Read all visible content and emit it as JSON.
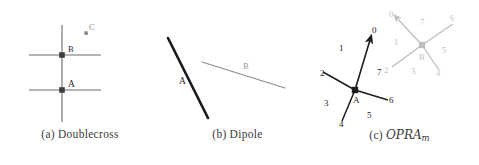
{
  "figure": {
    "panels": [
      {
        "id": "doublecross",
        "caption_label": "(a)",
        "caption_text": "Doublecross",
        "type": "doublecross-diagram",
        "colors": {
          "line": "#6b6b6b",
          "node": "#3d3d3d",
          "label": "#2b2b2b",
          "point": "#8a8a8a"
        },
        "nodes": [
          {
            "name": "A",
            "label": "A",
            "x": 62,
            "y": 90
          },
          {
            "name": "B",
            "label": "B",
            "x": 62,
            "y": 55
          },
          {
            "name": "C",
            "label": "C",
            "x": 86,
            "y": 33
          }
        ],
        "lines": [
          {
            "name": "vertical-axis",
            "x1": 62,
            "y1": 25,
            "x2": 62,
            "y2": 122
          },
          {
            "name": "horizontal-axis-b",
            "x1": 29,
            "y1": 55,
            "x2": 101,
            "y2": 55
          },
          {
            "name": "horizontal-axis-a",
            "x1": 29,
            "y1": 90,
            "x2": 101,
            "y2": 90
          }
        ]
      },
      {
        "id": "dipole",
        "caption_label": "(b)",
        "caption_text": "Dipole",
        "type": "dipole-diagram",
        "colors": {
          "line_a": "#1a1a1a",
          "line_b": "#8d8d8d",
          "label_a": "#2b2b2b",
          "label_b": "#9a9a9a"
        },
        "segments": [
          {
            "name": "segment-a",
            "label": "A",
            "x1": 13,
            "y1": 38,
            "x2": 53,
            "y2": 118,
            "label_x": 24,
            "label_y": 81,
            "width": 2.6,
            "color_key": "line_a"
          },
          {
            "name": "segment-b",
            "label": "B",
            "x1": 47,
            "y1": 62,
            "x2": 130,
            "y2": 88,
            "label_x": 88,
            "label_y": 66,
            "width": 1.2,
            "color_key": "line_b"
          }
        ]
      },
      {
        "id": "opram",
        "caption_label": "(c)",
        "caption_text": "OPRA",
        "caption_subscript": "m",
        "type": "opra-diagram",
        "colors": {
          "black": "#1d1d1d",
          "gray": "#bdbdbd",
          "label_black": "#1d1d1d",
          "label_gray": "#c2c2c2"
        },
        "nodes": [
          {
            "name": "A",
            "label": "A",
            "x": 35,
            "y": 90,
            "color_key": "black"
          },
          {
            "name": "B",
            "label": "B",
            "x": 102,
            "y": 45,
            "color_key": "gray"
          }
        ],
        "sectors_a": [
          "0",
          "1",
          "2",
          "3",
          "4",
          "5",
          "6",
          "7"
        ],
        "sectors_b": [
          "0",
          "1",
          "2",
          "3",
          "4",
          "5",
          "6",
          "7"
        ],
        "labels_a": [
          {
            "text": "0",
            "x": 52,
            "y": 30
          },
          {
            "text": "1",
            "x": 19,
            "y": 48
          },
          {
            "text": "2",
            "x": 1,
            "y": 73
          },
          {
            "text": "3",
            "x": 5,
            "y": 103
          },
          {
            "text": "4",
            "x": 20,
            "y": 126
          },
          {
            "text": "5",
            "x": 48,
            "y": 116
          },
          {
            "text": "6",
            "x": 70,
            "y": 101
          },
          {
            "text": "7",
            "x": 58,
            "y": 72
          }
        ],
        "labels_b": [
          {
            "text": "0",
            "x": 71,
            "y": 14
          },
          {
            "text": "1",
            "x": 76,
            "y": 42
          },
          {
            "text": "2",
            "x": 66,
            "y": 70
          },
          {
            "text": "3",
            "x": 93,
            "y": 71
          },
          {
            "text": "4",
            "x": 118,
            "y": 73
          },
          {
            "text": "5",
            "x": 124,
            "y": 50
          },
          {
            "text": "6",
            "x": 132,
            "y": 18
          },
          {
            "text": "7",
            "x": 102,
            "y": 22
          }
        ]
      }
    ]
  }
}
